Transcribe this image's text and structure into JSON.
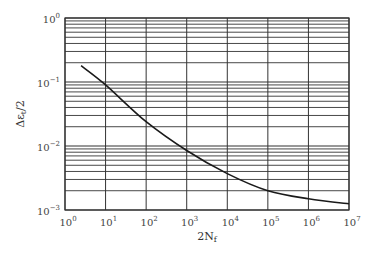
{
  "chart_data": {
    "type": "line",
    "title": "",
    "xlabel": "2N_f",
    "ylabel": "Δε_t/2",
    "xscale": "log",
    "yscale": "log",
    "xlim": [
      1,
      10000000
    ],
    "ylim": [
      0.001,
      1
    ],
    "grid": true,
    "x_tick_labels": [
      "10^0",
      "10^1",
      "10^2",
      "10^3",
      "10^4",
      "10^5",
      "10^6",
      "10^7"
    ],
    "y_tick_labels": [
      "10^-3",
      "10^-2",
      "10^-1",
      "10^0"
    ],
    "series": [
      {
        "name": "strain-life curve",
        "x": [
          2.5,
          10,
          100,
          1000,
          10000,
          100000,
          1000000,
          10000000
        ],
        "y": [
          0.18,
          0.09,
          0.024,
          0.0085,
          0.0037,
          0.002,
          0.0015,
          0.00125
        ]
      }
    ],
    "legend": null
  },
  "axes": {
    "x_label_main": "2N",
    "x_label_sub": "f",
    "y_label_main": "Δε",
    "y_label_sub": "t",
    "y_label_tail": "/2"
  },
  "colors": {
    "line": "#1a1a1a",
    "grid": "#333333",
    "text": "#444444"
  }
}
